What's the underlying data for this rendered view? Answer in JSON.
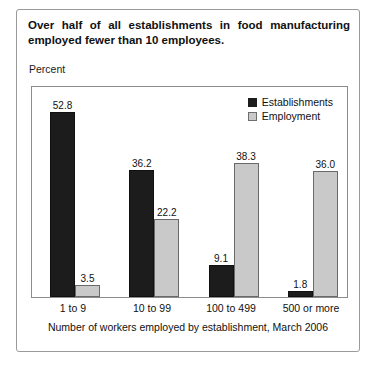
{
  "figure": {
    "title_line1": "Over half of all establishments in food manufacturing",
    "title_line2": "employed fewer than 10 employees.",
    "y_axis_caption": "Percent",
    "footer": "Number of workers employed by establishment, March 2006"
  },
  "colors": {
    "establishments": "#1c1c1c",
    "employment": "#c9c9c9",
    "frame": "#8c8c8c",
    "outer_border": "#9a9a9a",
    "text": "#111111"
  },
  "chart_data": {
    "type": "bar",
    "title": "Over half of all establishments in food manufacturing employed fewer than 10 employees.",
    "xlabel": "Number of workers employed by establishment, March 2006",
    "ylabel": "Percent",
    "ylim": [
      0,
      60
    ],
    "grid": false,
    "legend_position": "top-right",
    "categories": [
      "1 to 9",
      "10 to 99",
      "100 to 499",
      "500 or more"
    ],
    "series": [
      {
        "name": "Establishments",
        "color": "#1c1c1c",
        "values": [
          52.8,
          36.2,
          9.1,
          1.8
        ],
        "labels": [
          "52.8",
          "36.2",
          "9.1",
          "1.8"
        ]
      },
      {
        "name": "Employment",
        "color": "#c9c9c9",
        "values": [
          3.5,
          22.2,
          38.3,
          36.0
        ],
        "labels": [
          "3.5",
          "22.2",
          "38.3",
          "36.0"
        ]
      }
    ]
  }
}
